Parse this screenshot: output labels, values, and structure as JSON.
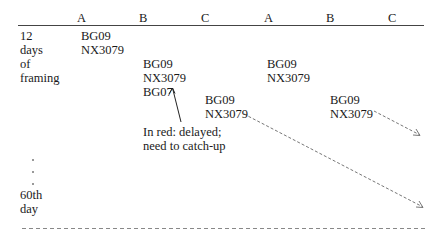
{
  "header": {
    "columns": [
      "A",
      "B",
      "C",
      "A",
      "B",
      "C"
    ]
  },
  "row_label": {
    "top": [
      "12",
      "days",
      "of",
      "framing"
    ],
    "ellipsis": [
      ".",
      ".",
      "."
    ],
    "bottom": [
      "60th",
      "day"
    ]
  },
  "cells": {
    "a1": [
      "BG09",
      "NX3079"
    ],
    "b1": [
      "BG09",
      "NX3079",
      "BG07"
    ],
    "c1": [
      "BG09",
      "NX3079"
    ],
    "a2": [
      "BG09",
      "NX3079"
    ],
    "b2": [
      "BG09",
      "NX3079"
    ]
  },
  "annotation": {
    "line1": "In red: delayed;",
    "line2": "need to catch-up"
  },
  "colors": {
    "text": "#1a1a1a",
    "line": "#444444",
    "dashed": "#777777"
  }
}
